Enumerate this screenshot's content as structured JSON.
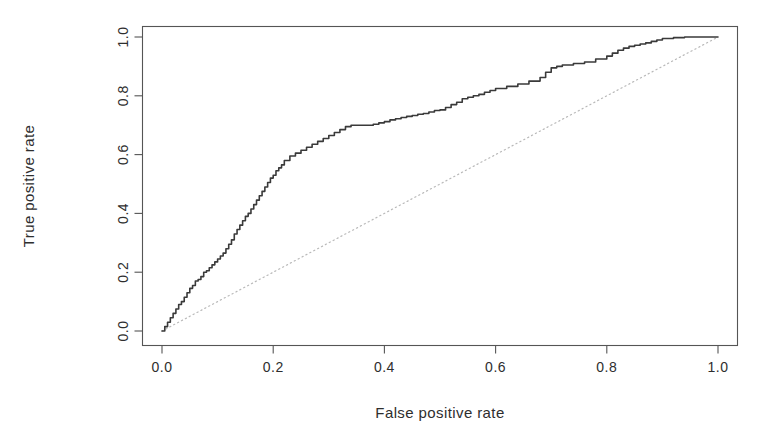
{
  "chart_data": {
    "type": "line",
    "title": "",
    "xlabel": "False positive rate",
    "ylabel": "True positive rate",
    "xlim": [
      0.0,
      1.0
    ],
    "ylim": [
      0.0,
      1.0
    ],
    "grid": false,
    "legend": null,
    "xticks": [
      "0.0",
      "0.2",
      "0.4",
      "0.6",
      "0.8",
      "1.0"
    ],
    "xtick_values": [
      0.0,
      0.2,
      0.4,
      0.6,
      0.8,
      1.0
    ],
    "yticks": [
      "0.0",
      "0.2",
      "0.4",
      "0.6",
      "0.8",
      "1.0"
    ],
    "ytick_values": [
      0.0,
      0.2,
      0.4,
      0.6,
      0.8,
      1.0
    ],
    "series": [
      {
        "name": "ROC curve",
        "style": "step",
        "color": "#3a3a3a",
        "x": [
          0.0,
          0.005,
          0.01,
          0.015,
          0.02,
          0.025,
          0.03,
          0.035,
          0.04,
          0.045,
          0.05,
          0.055,
          0.06,
          0.065,
          0.07,
          0.075,
          0.08,
          0.085,
          0.09,
          0.095,
          0.1,
          0.105,
          0.11,
          0.115,
          0.12,
          0.125,
          0.13,
          0.135,
          0.14,
          0.145,
          0.15,
          0.155,
          0.16,
          0.165,
          0.17,
          0.175,
          0.18,
          0.185,
          0.19,
          0.195,
          0.2,
          0.205,
          0.21,
          0.215,
          0.22,
          0.23,
          0.24,
          0.25,
          0.26,
          0.27,
          0.28,
          0.29,
          0.3,
          0.31,
          0.32,
          0.33,
          0.34,
          0.35,
          0.36,
          0.37,
          0.38,
          0.39,
          0.4,
          0.41,
          0.42,
          0.43,
          0.44,
          0.45,
          0.46,
          0.47,
          0.48,
          0.49,
          0.5,
          0.51,
          0.52,
          0.53,
          0.54,
          0.55,
          0.56,
          0.57,
          0.58,
          0.59,
          0.6,
          0.62,
          0.64,
          0.66,
          0.68,
          0.69,
          0.7,
          0.71,
          0.72,
          0.74,
          0.76,
          0.78,
          0.8,
          0.81,
          0.82,
          0.83,
          0.84,
          0.85,
          0.86,
          0.87,
          0.88,
          0.89,
          0.9,
          0.92,
          0.94,
          0.96,
          0.98,
          1.0
        ],
        "y": [
          0.0,
          0.015,
          0.03,
          0.045,
          0.06,
          0.075,
          0.09,
          0.1,
          0.115,
          0.13,
          0.145,
          0.155,
          0.17,
          0.175,
          0.185,
          0.2,
          0.205,
          0.215,
          0.225,
          0.235,
          0.245,
          0.255,
          0.265,
          0.28,
          0.295,
          0.31,
          0.33,
          0.345,
          0.36,
          0.375,
          0.39,
          0.4,
          0.415,
          0.43,
          0.445,
          0.46,
          0.475,
          0.49,
          0.505,
          0.52,
          0.53,
          0.545,
          0.555,
          0.565,
          0.58,
          0.595,
          0.605,
          0.615,
          0.625,
          0.635,
          0.645,
          0.655,
          0.665,
          0.675,
          0.685,
          0.695,
          0.7,
          0.7,
          0.7,
          0.7,
          0.703,
          0.708,
          0.712,
          0.718,
          0.722,
          0.726,
          0.73,
          0.733,
          0.737,
          0.74,
          0.745,
          0.75,
          0.752,
          0.76,
          0.77,
          0.778,
          0.79,
          0.795,
          0.8,
          0.805,
          0.812,
          0.818,
          0.825,
          0.832,
          0.84,
          0.85,
          0.862,
          0.88,
          0.895,
          0.9,
          0.905,
          0.91,
          0.915,
          0.925,
          0.935,
          0.945,
          0.955,
          0.962,
          0.968,
          0.972,
          0.976,
          0.98,
          0.985,
          0.99,
          0.995,
          0.998,
          1.0,
          1.0,
          1.0,
          1.0
        ]
      },
      {
        "name": "chance diagonal",
        "style": "dotted",
        "color": "#b9b9b9",
        "x": [
          0.0,
          1.0
        ],
        "y": [
          0.0,
          1.0
        ]
      }
    ]
  }
}
